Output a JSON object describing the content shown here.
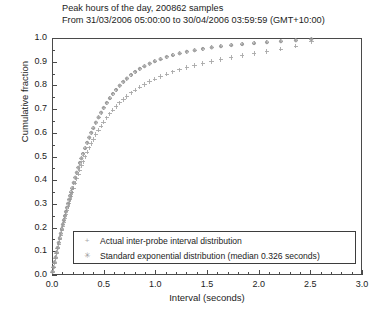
{
  "chart_data": {
    "type": "scatter",
    "title": "Peak hours of the day, 200862 samples",
    "subtitle": "From 31/03/2006 05:00:00 to 30/04/2006 03:59:59 (GMT+10:00)",
    "xlabel": "Interval (seconds)",
    "ylabel": "Cumulative fraction",
    "xlim": [
      0.0,
      3.0
    ],
    "ylim": [
      0.0,
      1.0
    ],
    "grid": false,
    "legend_position": "lower right",
    "xticks": [
      "0.0",
      "0.5",
      "1.0",
      "1.5",
      "2.0",
      "2.5",
      "3.0"
    ],
    "xtick_values": [
      0.0,
      0.5,
      1.0,
      1.5,
      2.0,
      2.5,
      3.0
    ],
    "x_minor_tick_step": 0.1,
    "yticks": [
      "0.0",
      "0.1",
      "0.2",
      "0.3",
      "0.4",
      "0.5",
      "0.6",
      "0.7",
      "0.8",
      "0.9",
      "1.0"
    ],
    "ytick_values": [
      0.0,
      0.1,
      0.2,
      0.3,
      0.4,
      0.5,
      0.6,
      0.7,
      0.8,
      0.9,
      1.0
    ],
    "series": [
      {
        "name": "Actual inter-probe interval distribution",
        "marker": "plus",
        "color": "#a8a8a8",
        "points": [
          [
            0.005,
            0.012
          ],
          [
            0.015,
            0.03
          ],
          [
            0.025,
            0.05
          ],
          [
            0.035,
            0.07
          ],
          [
            0.045,
            0.09
          ],
          [
            0.055,
            0.11
          ],
          [
            0.065,
            0.13
          ],
          [
            0.075,
            0.15
          ],
          [
            0.085,
            0.168
          ],
          [
            0.095,
            0.186
          ],
          [
            0.105,
            0.204
          ],
          [
            0.115,
            0.221
          ],
          [
            0.125,
            0.238
          ],
          [
            0.135,
            0.255
          ],
          [
            0.145,
            0.271
          ],
          [
            0.155,
            0.287
          ],
          [
            0.165,
            0.302
          ],
          [
            0.175,
            0.317
          ],
          [
            0.185,
            0.332
          ],
          [
            0.195,
            0.346
          ],
          [
            0.21,
            0.367
          ],
          [
            0.225,
            0.387
          ],
          [
            0.24,
            0.406
          ],
          [
            0.255,
            0.425
          ],
          [
            0.27,
            0.443
          ],
          [
            0.285,
            0.46
          ],
          [
            0.3,
            0.477
          ],
          [
            0.32,
            0.498
          ],
          [
            0.34,
            0.518
          ],
          [
            0.36,
            0.537
          ],
          [
            0.38,
            0.555
          ],
          [
            0.4,
            0.572
          ],
          [
            0.425,
            0.592
          ],
          [
            0.45,
            0.611
          ],
          [
            0.475,
            0.628
          ],
          [
            0.5,
            0.645
          ],
          [
            0.53,
            0.663
          ],
          [
            0.56,
            0.68
          ],
          [
            0.59,
            0.696
          ],
          [
            0.62,
            0.711
          ],
          [
            0.655,
            0.727
          ],
          [
            0.69,
            0.741
          ],
          [
            0.725,
            0.754
          ],
          [
            0.765,
            0.768
          ],
          [
            0.805,
            0.78
          ],
          [
            0.85,
            0.793
          ],
          [
            0.895,
            0.804
          ],
          [
            0.945,
            0.816
          ],
          [
            0.995,
            0.826
          ],
          [
            1.05,
            0.837
          ],
          [
            1.11,
            0.847
          ],
          [
            1.17,
            0.857
          ],
          [
            1.235,
            0.866
          ],
          [
            1.305,
            0.875
          ],
          [
            1.38,
            0.884
          ],
          [
            1.46,
            0.893
          ],
          [
            1.545,
            0.901
          ],
          [
            1.635,
            0.909
          ],
          [
            1.735,
            0.918
          ],
          [
            1.84,
            0.926
          ],
          [
            1.955,
            0.934
          ],
          [
            2.08,
            0.943
          ],
          [
            2.215,
            0.953
          ],
          [
            2.36,
            0.966
          ],
          [
            2.51,
            0.984
          ]
        ]
      },
      {
        "name": "Standard exponential distribution (median 0.326 seconds)",
        "marker": "circle",
        "color": "#999999",
        "points": [
          [
            0.005,
            0.014
          ],
          [
            0.015,
            0.033
          ],
          [
            0.025,
            0.054
          ],
          [
            0.035,
            0.074
          ],
          [
            0.045,
            0.095
          ],
          [
            0.055,
            0.115
          ],
          [
            0.065,
            0.136
          ],
          [
            0.075,
            0.156
          ],
          [
            0.085,
            0.175
          ],
          [
            0.095,
            0.194
          ],
          [
            0.105,
            0.213
          ],
          [
            0.115,
            0.231
          ],
          [
            0.125,
            0.249
          ],
          [
            0.135,
            0.267
          ],
          [
            0.145,
            0.284
          ],
          [
            0.155,
            0.301
          ],
          [
            0.165,
            0.318
          ],
          [
            0.175,
            0.334
          ],
          [
            0.185,
            0.35
          ],
          [
            0.195,
            0.366
          ],
          [
            0.21,
            0.389
          ],
          [
            0.225,
            0.411
          ],
          [
            0.24,
            0.432
          ],
          [
            0.255,
            0.453
          ],
          [
            0.27,
            0.473
          ],
          [
            0.285,
            0.492
          ],
          [
            0.3,
            0.511
          ],
          [
            0.32,
            0.535
          ],
          [
            0.34,
            0.558
          ],
          [
            0.36,
            0.58
          ],
          [
            0.38,
            0.6
          ],
          [
            0.4,
            0.62
          ],
          [
            0.425,
            0.643
          ],
          [
            0.45,
            0.665
          ],
          [
            0.475,
            0.685
          ],
          [
            0.5,
            0.705
          ],
          [
            0.53,
            0.726
          ],
          [
            0.56,
            0.746
          ],
          [
            0.59,
            0.764
          ],
          [
            0.62,
            0.781
          ],
          [
            0.655,
            0.799
          ],
          [
            0.69,
            0.815
          ],
          [
            0.725,
            0.829
          ],
          [
            0.765,
            0.844
          ],
          [
            0.805,
            0.857
          ],
          [
            0.85,
            0.87
          ],
          [
            0.895,
            0.881
          ],
          [
            0.945,
            0.892
          ],
          [
            0.995,
            0.902
          ],
          [
            1.05,
            0.911
          ],
          [
            1.11,
            0.92
          ],
          [
            1.17,
            0.928
          ],
          [
            1.235,
            0.935
          ],
          [
            1.305,
            0.942
          ],
          [
            1.38,
            0.948
          ],
          [
            1.46,
            0.954
          ],
          [
            1.545,
            0.96
          ],
          [
            1.635,
            0.965
          ],
          [
            1.735,
            0.97
          ],
          [
            1.84,
            0.974
          ],
          [
            1.955,
            0.978
          ],
          [
            2.08,
            0.982
          ],
          [
            2.215,
            0.986
          ],
          [
            2.36,
            0.99
          ],
          [
            2.51,
            0.995
          ]
        ]
      }
    ]
  },
  "legend": {
    "entries": [
      {
        "label": "Actual inter-probe interval distribution",
        "glyph": "+"
      },
      {
        "label": "Standard exponential distribution (median 0.326 seconds)",
        "glyph": "✳"
      }
    ]
  }
}
